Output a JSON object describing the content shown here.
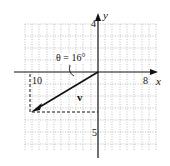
{
  "figure": {
    "x_axis_label": "x",
    "y_axis_label": "y",
    "x_tick_left": "10",
    "x_tick_right": "8",
    "y_tick_top": "4",
    "y_tick_bottom": "5",
    "vector_label": "v",
    "angle_label": "θ = 16°",
    "colors": {
      "grid": "#888888",
      "axes": "#111111",
      "vector": "#111111"
    }
  }
}
